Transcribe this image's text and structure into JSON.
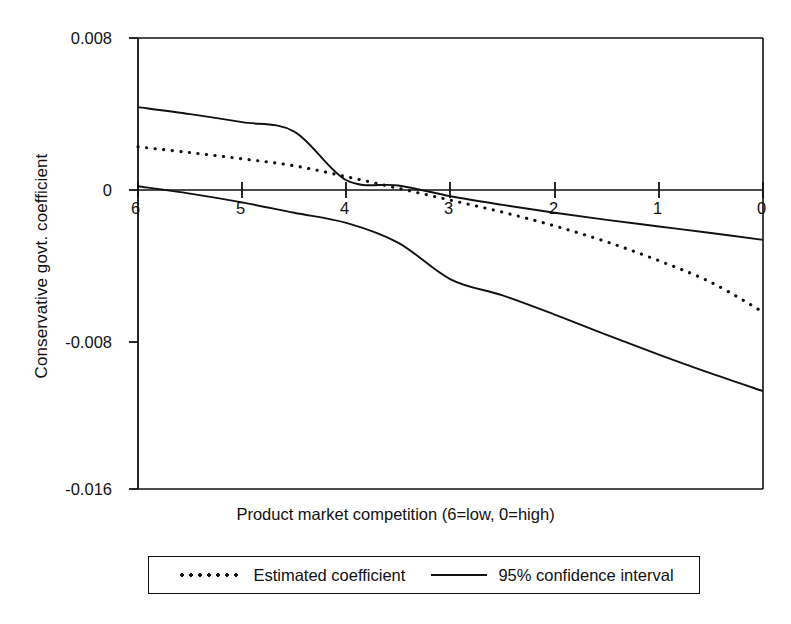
{
  "chart_data": {
    "type": "line",
    "title": "",
    "xlabel": "Product market competition (6=low, 0=high)",
    "ylabel": "Conservative govt. coefficient",
    "xlim": [
      6,
      0
    ],
    "ylim": [
      -0.016,
      0.008
    ],
    "x_reversed": true,
    "grid": false,
    "legend_position": "below-outside",
    "xticks": [
      "6",
      "5",
      "4",
      "3",
      "2",
      "1",
      "0"
    ],
    "xtick_values": [
      6,
      5,
      4,
      3,
      2,
      1,
      0
    ],
    "yticks": [
      "0.008",
      "0",
      "-0.008",
      "-0.016"
    ],
    "ytick_values": [
      0.008,
      0,
      -0.008,
      -0.016
    ],
    "x": [
      6,
      5.5,
      5,
      4.5,
      4,
      3.5,
      3,
      2.5,
      2,
      1.5,
      1,
      0.5,
      0
    ],
    "series": [
      {
        "name": "95% confidence interval",
        "role": "upper-bound",
        "style": "solid",
        "color": "#111111",
        "values": [
          0.00432,
          0.00395,
          0.00352,
          0.00302,
          0.00043,
          0.00015,
          -0.00042,
          -0.00088,
          -0.0013,
          -0.00168,
          -0.00203,
          -0.00238,
          -0.00274
        ]
      },
      {
        "name": "Estimated coefficient",
        "role": "point-estimate",
        "style": "dotted",
        "color": "#111111",
        "values": [
          0.00221,
          0.0019,
          0.00157,
          0.0012,
          0.00062,
          0.0,
          -0.00063,
          -0.00127,
          -0.002,
          -0.00285,
          -0.00385,
          -0.005,
          -0.00658
        ]
      },
      {
        "name": "95% confidence interval",
        "role": "lower-bound",
        "style": "solid",
        "color": "#111111",
        "values": [
          0.00011,
          -0.00028,
          -0.00075,
          -0.0013,
          -0.00184,
          -0.0029,
          -0.00484,
          -0.0057,
          -0.00672,
          -0.0078,
          -0.00885,
          -0.00985,
          -0.01079
        ]
      }
    ],
    "legend": [
      {
        "label": "Estimated coefficient",
        "style": "dotted"
      },
      {
        "label": "95% confidence interval",
        "style": "solid"
      }
    ],
    "zero_line": true
  },
  "axes": {
    "y_title": "Conservative govt. coefficient",
    "x_title": "Product market competition (6=low, 0=high)",
    "y_tick_labels": [
      "0.008",
      "0",
      "-0.008",
      "-0.016"
    ],
    "x_tick_labels": [
      "6",
      "5",
      "4",
      "3",
      "2",
      "1",
      "0"
    ]
  },
  "legend": {
    "estimated_label": "Estimated coefficient",
    "ci_label": "95% confidence interval"
  },
  "colors": {
    "ink": "#111111",
    "background": "#ffffff"
  }
}
